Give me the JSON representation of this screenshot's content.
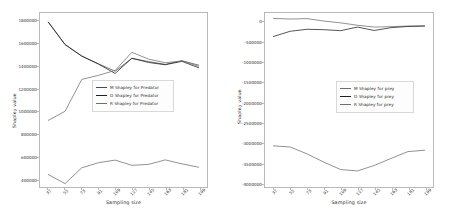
{
  "figure": {
    "background": "#ffffff",
    "width": 451,
    "height": 221
  },
  "chart_data": [
    {
      "type": "line",
      "panel": "left",
      "title": "",
      "xlabel": "Sampling size",
      "ylabel": "Shapley value",
      "x": [
        37,
        55,
        73,
        91,
        109,
        127,
        145,
        163,
        181,
        199
      ],
      "xticklabels": [
        "37",
        "55",
        "73",
        "91",
        "109",
        "127",
        "145",
        "163",
        "181",
        "199"
      ],
      "yticklabels": [
        "400000",
        "600000",
        "800000",
        "1000000",
        "1200000",
        "1400000",
        "1600000",
        "1800000"
      ],
      "yticks": [
        400000,
        600000,
        800000,
        1000000,
        1200000,
        1400000,
        1600000,
        1800000
      ],
      "xlim": [
        28,
        208
      ],
      "ylim": [
        330000,
        1870000
      ],
      "grid": false,
      "legend_position": "center right",
      "series": [
        {
          "name": "M Shapley for Predator",
          "color": "#4a4a4a",
          "values": [
            1790000,
            1592000,
            1490000,
            1420000,
            1355000,
            1468000,
            1440000,
            1415000,
            1448000,
            1408000
          ]
        },
        {
          "name": "D Shapley for Predator",
          "color": "#1f1f1f",
          "values": [
            1788000,
            1590000,
            1488000,
            1418000,
            1335000,
            1470000,
            1432000,
            1412000,
            1442000,
            1385000
          ]
        },
        {
          "name": "R Shapley for Predator",
          "color": "#6e6e6e",
          "values": [
            920000,
            1000000,
            1282000,
            1318000,
            1362000,
            1522000,
            1462000,
            1430000,
            1445000,
            1398000
          ]
        },
        {
          "name": "R Shapley for Predator lower",
          "color": "#6e6e6e",
          "values": [
            440000,
            360000,
            500000,
            545000,
            568000,
            522000,
            530000,
            570000,
            535000,
            505000
          ]
        }
      ]
    },
    {
      "type": "line",
      "panel": "right",
      "title": "",
      "xlabel": "Sampling size",
      "ylabel": "Shapley value",
      "x": [
        37,
        55,
        73,
        91,
        109,
        127,
        145,
        163,
        181,
        199
      ],
      "xticklabels": [
        "37",
        "55",
        "73",
        "91",
        "109",
        "127",
        "145",
        "163",
        "181",
        "199"
      ],
      "yticklabels": [
        "-4000000",
        "-3500000",
        "-3000000",
        "-2500000",
        "-2000000",
        "-1500000",
        "-1000000",
        "-500000",
        "0"
      ],
      "yticks": [
        -4000000,
        -3500000,
        -3000000,
        -2500000,
        -2000000,
        -1500000,
        -1000000,
        -500000,
        0
      ],
      "xlim": [
        28,
        208
      ],
      "ylim": [
        -4100000,
        230000
      ],
      "grid": false,
      "legend_position": "center right",
      "series": [
        {
          "name": "M Shapley for prey",
          "color": "#6e6e6e",
          "values": [
            95000,
            80000,
            90000,
            30000,
            -15000,
            -75000,
            -120000,
            -110000,
            -95000,
            -90000
          ]
        },
        {
          "name": "D Shapley for prey",
          "color": "#1f1f1f",
          "values": [
            -355000,
            -225000,
            -175000,
            -185000,
            -210000,
            -120000,
            -205000,
            -135000,
            -105000,
            -95000
          ]
        },
        {
          "name": "R Shapley for prey",
          "color": "#6e6e6e",
          "values": [
            -3075000,
            -3105000,
            -3275000,
            -3480000,
            -3665000,
            -3700000,
            -3565000,
            -3390000,
            -3220000,
            -3185000
          ]
        }
      ]
    }
  ],
  "panels": {
    "left": {
      "legend": [
        {
          "label": "M Shapley for Predator",
          "color": "#4a4a4a"
        },
        {
          "label": "D Shapley for Predator",
          "color": "#1f1f1f"
        },
        {
          "label": "R Shapley for Predator",
          "color": "#6e6e6e"
        }
      ]
    },
    "right": {
      "legend": [
        {
          "label": "M Shapley for prey",
          "color": "#6e6e6e"
        },
        {
          "label": "D Shapley for prey",
          "color": "#1f1f1f"
        },
        {
          "label": "R Shapley for prey",
          "color": "#6e6e6e"
        }
      ]
    }
  }
}
